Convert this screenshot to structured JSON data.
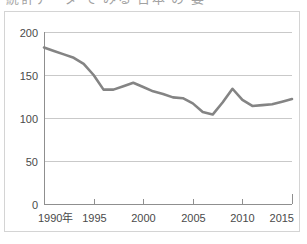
{
  "title": {
    "text": "統計データ で みる 日本 の 姿",
    "clipped": true
  },
  "chart_data": {
    "type": "line",
    "title": "",
    "xlabel": "",
    "ylabel": "",
    "xlim": [
      1990,
      2015
    ],
    "ylim": [
      0,
      200
    ],
    "grid": true,
    "legend": "none",
    "line_color": "#848484",
    "x_tick_labels": [
      "1990年",
      "1995",
      "2000",
      "2005",
      "2010",
      "2015"
    ],
    "x_tick_values": [
      1990,
      1995,
      2000,
      2005,
      2010,
      2015
    ],
    "y_tick_labels": [
      "0",
      "50",
      "100",
      "150",
      "200"
    ],
    "y_tick_values": [
      0,
      50,
      100,
      150,
      200
    ],
    "x": [
      1990,
      1991,
      1992,
      1993,
      1994,
      1995,
      1996,
      1997,
      1998,
      1999,
      2000,
      2001,
      2002,
      2003,
      2004,
      2005,
      2006,
      2007,
      2008,
      2009,
      2010,
      2011,
      2012,
      2013,
      2014,
      2015
    ],
    "series": [
      {
        "name": "series-1",
        "values": [
          182,
          178,
          174,
          170,
          163,
          150,
          133,
          133,
          137,
          141,
          136,
          131,
          128,
          124,
          123,
          117,
          107,
          104,
          118,
          134,
          121,
          114,
          115,
          116,
          119,
          122
        ]
      }
    ]
  },
  "colors": {
    "line": "#848484",
    "gridline": "#c9c9c9",
    "axis": "#8f8f8f",
    "frame": "#d4d4d4",
    "text": "#4a4a4a",
    "background": "#ffffff"
  }
}
